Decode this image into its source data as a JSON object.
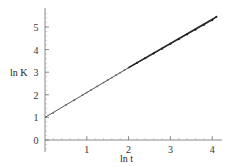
{
  "chart_data": {
    "type": "line",
    "title": "",
    "xlabel": "ln t",
    "ylabel": "ln K",
    "xlim": [
      0,
      4.1
    ],
    "ylim": [
      -0.4,
      5.8
    ],
    "x_ticks": [
      1,
      2,
      3,
      4
    ],
    "y_ticks": [
      0,
      1,
      2,
      3,
      4,
      5
    ],
    "grid": false,
    "legend": "none",
    "series": [
      {
        "name": "fit line",
        "style": "line",
        "x": [
          0,
          1,
          2,
          3,
          4,
          4.1
        ],
        "y": [
          1.0,
          2.1,
          3.2,
          4.25,
          5.3,
          5.45
        ]
      },
      {
        "name": "data points",
        "style": "markers",
        "x": [
          0.2,
          0.5,
          0.7,
          0.9,
          1.0,
          1.1,
          1.25,
          1.4,
          1.5,
          1.6,
          1.7,
          1.8,
          1.9,
          2.0,
          2.2,
          2.4,
          2.6,
          2.8,
          3.0,
          3.2,
          3.4,
          3.6,
          3.8,
          4.0,
          4.1
        ],
        "y": [
          1.2,
          1.55,
          1.77,
          1.99,
          2.1,
          2.21,
          2.37,
          2.54,
          2.65,
          2.76,
          2.87,
          2.98,
          3.09,
          3.2,
          3.41,
          3.62,
          3.83,
          4.04,
          4.25,
          4.46,
          4.67,
          4.88,
          5.09,
          5.3,
          5.45
        ]
      }
    ]
  },
  "axes": {
    "x_label": "ln t",
    "y_label": "ln K",
    "x_tick_labels": [
      "1",
      "2",
      "3",
      "4"
    ],
    "y_tick_labels": [
      "0",
      "1",
      "2",
      "3",
      "4",
      "5"
    ]
  }
}
